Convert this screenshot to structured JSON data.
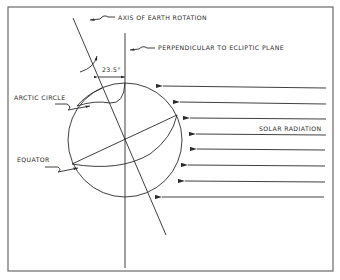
{
  "diagram": {
    "labels": {
      "axis": "AXIS OF EARTH ROTATION",
      "perpendicular": "PERPENDICULAR TO ECLIPTIC PLANE",
      "angle": "23.5°",
      "arctic_circle": "ARCTIC CIRCLE",
      "equator": "EQUATOR",
      "solar_radiation": "SOLAR RADIATION"
    },
    "solar_rays_count": 8,
    "colors": {
      "ink": "#2a2a2a",
      "frame": "#6a6a6a",
      "background": "#ffffff"
    }
  }
}
